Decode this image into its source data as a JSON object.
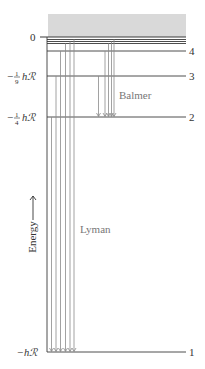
{
  "colors": {
    "continuum_fill": "#d9d9d9",
    "level_line": "#3a3a3a",
    "transition_line": "#8a8a8a",
    "label_text": "#333333",
    "series_text": "#777777"
  },
  "continuum": {
    "x": 48,
    "y": 14,
    "width": 138,
    "height": 23
  },
  "axis": {
    "x": 47,
    "y_top": 37,
    "y_bottom": 352,
    "label": "Energy",
    "label_x": 33,
    "label_y": 237,
    "arrow_top": 196,
    "arrow_bottom": 220
  },
  "energy_labels": [
    {
      "id": "zero",
      "text_parts": [
        "0"
      ],
      "y": 37
    },
    {
      "id": "minus-ninth",
      "prefix": "−",
      "num": "1",
      "den": "9",
      "suffix": "hℛ",
      "y": 76
    },
    {
      "id": "minus-quarter",
      "prefix": "−",
      "num": "1",
      "den": "4",
      "suffix": "hℛ",
      "y": 117
    },
    {
      "id": "minus-one",
      "prefix": "−",
      "suffix": "hℛ",
      "y": 352
    }
  ],
  "levels": [
    {
      "n": "",
      "y": 37,
      "x1": 40,
      "x2": 186
    },
    {
      "n": "",
      "y": 39.5,
      "x1": 47,
      "x2": 186
    },
    {
      "n": "",
      "y": 41.5,
      "x1": 47,
      "x2": 186
    },
    {
      "n": "",
      "y": 43.5,
      "x1": 47,
      "x2": 186
    },
    {
      "n": "4",
      "y": 51,
      "x1": 47,
      "x2": 186
    },
    {
      "n": "3",
      "y": 76,
      "x1": 47,
      "x2": 186
    },
    {
      "n": "2",
      "y": 117,
      "x1": 47,
      "x2": 186
    },
    {
      "n": "1",
      "y": 352,
      "x1": 47,
      "x2": 186
    }
  ],
  "series": [
    {
      "name": "Balmer",
      "label_x": 119,
      "label_y": 99,
      "transitions": [
        {
          "x": 98.5,
          "from": 76,
          "to": 117
        },
        {
          "x": 105,
          "from": 51,
          "to": 117
        },
        {
          "x": 108.5,
          "from": 43.5,
          "to": 117
        },
        {
          "x": 111.5,
          "from": 41.5,
          "to": 117
        },
        {
          "x": 114,
          "from": 39.5,
          "to": 117
        }
      ]
    },
    {
      "name": "Lyman",
      "label_x": 80,
      "label_y": 233,
      "transitions": [
        {
          "x": 51.5,
          "from": 117,
          "to": 352
        },
        {
          "x": 56,
          "from": 76,
          "to": 352
        },
        {
          "x": 60.5,
          "from": 51,
          "to": 352
        },
        {
          "x": 65.5,
          "from": 43.5,
          "to": 352
        },
        {
          "x": 70,
          "from": 41.5,
          "to": 352
        },
        {
          "x": 74,
          "from": 39.5,
          "to": 352
        }
      ]
    }
  ]
}
